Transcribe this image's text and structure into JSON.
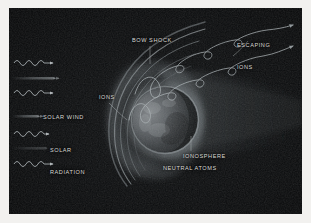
{
  "figure": {
    "background_color": "#090a0b",
    "frame_color": "#f2f1ef",
    "label_color": "#d9d9d6",
    "glow_color": "#b9c2c6"
  },
  "labels": {
    "bow_shock": "BOW SHOCK",
    "escaping_ions_line1": "ESCAPING",
    "escaping_ions_line2": "IONS",
    "ions": "IONS",
    "ionosphere": "IONOSPHERE",
    "neutral_atoms": "NEUTRAL ATOMS",
    "solar_wind": "SOLAR WIND",
    "solar_radiation_line1": "SOLAR",
    "solar_radiation_line2": "RADIATION"
  },
  "icons": {
    "wave_arrow": "solar-radiation-wave-arrow",
    "streak_arrow": "solar-wind-streak-arrow",
    "ion_trajectory": "escaping-ion-trajectory-arrow",
    "planet": "planet-sphere",
    "bow_shock_arc": "bow-shock-arc",
    "magnetotail": "magnetotail"
  }
}
